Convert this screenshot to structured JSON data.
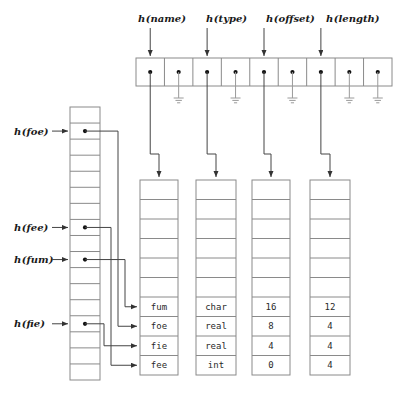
{
  "figure": {
    "type": "diagram"
  },
  "top_table": {
    "name": "hash-bucket-array",
    "cell_count": 9,
    "cells": [
      {
        "index": 0,
        "has_dot": true,
        "link": "pointer",
        "target": "name-column"
      },
      {
        "index": 1,
        "has_dot": true,
        "link": "ground"
      },
      {
        "index": 2,
        "has_dot": true,
        "link": "pointer",
        "target": "type-column"
      },
      {
        "index": 3,
        "has_dot": true,
        "link": "ground"
      },
      {
        "index": 4,
        "has_dot": true,
        "link": "pointer",
        "target": "offset-column"
      },
      {
        "index": 5,
        "has_dot": true,
        "link": "ground"
      },
      {
        "index": 6,
        "has_dot": true,
        "link": "pointer",
        "target": "length-column"
      },
      {
        "index": 7,
        "has_dot": true,
        "link": "ground"
      },
      {
        "index": 8,
        "has_dot": true,
        "link": "ground"
      }
    ]
  },
  "top_labels": [
    {
      "name": "h-name-label",
      "fn": "h",
      "arg": "(name)"
    },
    {
      "name": "h-type-label",
      "fn": "h",
      "arg": "(type)"
    },
    {
      "name": "h-offset-label",
      "fn": "h",
      "arg": "(offset)"
    },
    {
      "name": "h-length-label",
      "fn": "h",
      "arg": "(length)"
    }
  ],
  "left_labels": [
    {
      "name": "h-foe-label",
      "fn": "h",
      "arg": "(foe)",
      "row": 1
    },
    {
      "name": "h-fee-label",
      "fn": "h",
      "arg": "(fee)",
      "row": 7
    },
    {
      "name": "h-fum-label",
      "fn": "h",
      "arg": "(fum)",
      "row": 9
    },
    {
      "name": "h-fie-label",
      "fn": "h",
      "arg": "(fie)",
      "row": 13
    }
  ],
  "left_table": {
    "name": "symbol-hash-array",
    "cell_count": 17,
    "dot_rows": [
      1,
      7,
      9,
      13
    ]
  },
  "columns": [
    {
      "name": "name-column",
      "header": "h(name)",
      "rows": [
        "",
        "",
        "",
        "",
        "",
        "",
        "fum",
        "foe",
        "fie",
        "fee"
      ]
    },
    {
      "name": "type-column",
      "header": "h(type)",
      "rows": [
        "",
        "",
        "",
        "",
        "",
        "",
        "char",
        "real",
        "real",
        "int"
      ]
    },
    {
      "name": "offset-column",
      "header": "h(offset)",
      "rows": [
        "",
        "",
        "",
        "",
        "",
        "",
        "16",
        "8",
        "4",
        "0"
      ]
    },
    {
      "name": "length-column",
      "header": "h(length)",
      "rows": [
        "",
        "",
        "",
        "",
        "",
        "",
        "12",
        "4",
        "4",
        "4"
      ]
    }
  ],
  "colors": {
    "stroke": "#8a8a8a",
    "text": "#2a2a2a",
    "dot": "#111111",
    "background": "#ffffff"
  }
}
